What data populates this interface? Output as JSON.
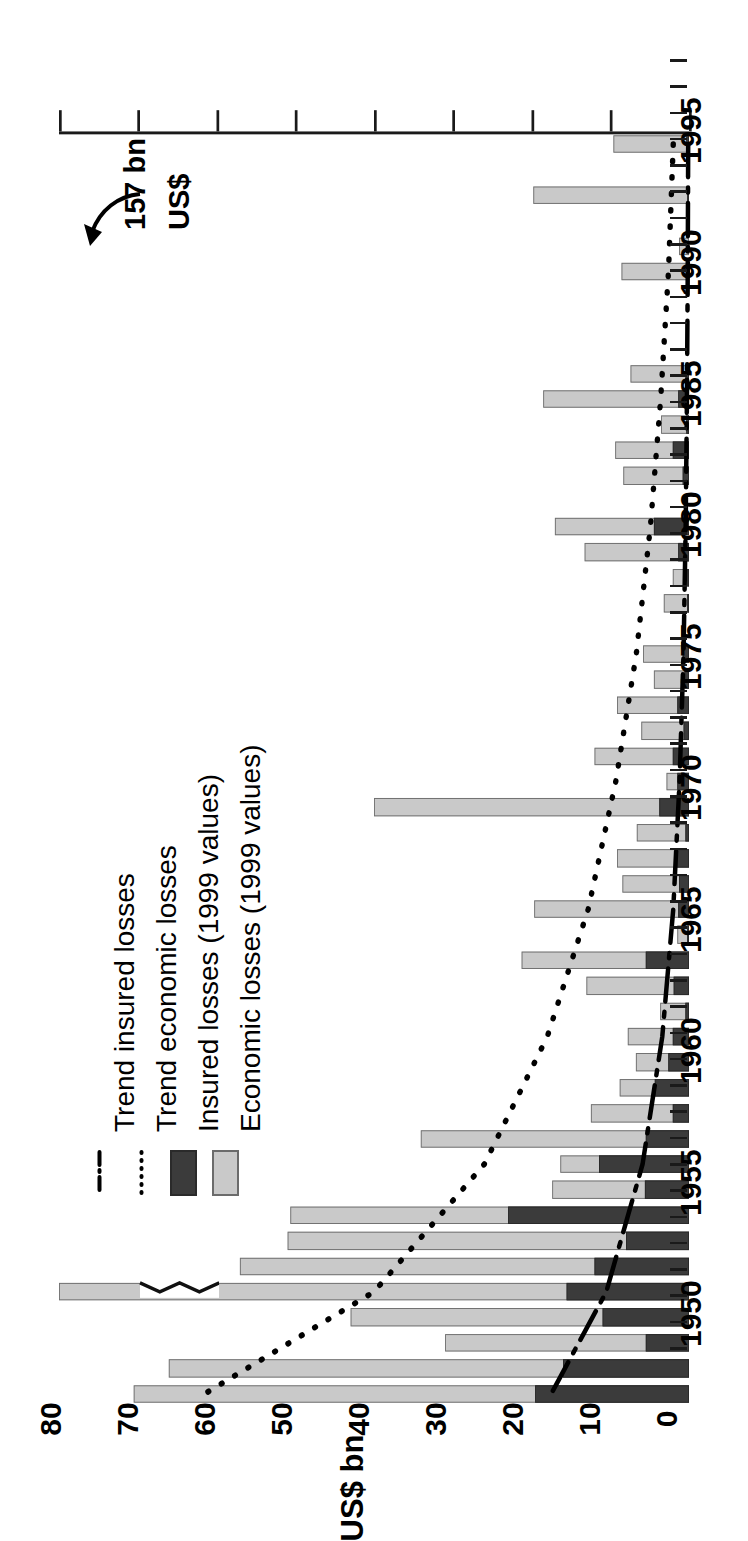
{
  "figure": {
    "orientation": "rotated-90",
    "value_axis_title": "US$ bn",
    "category_axis_name": "Year"
  },
  "legend": {
    "position": "left",
    "items": [
      {
        "label": "Economic losses (1999 values)",
        "marker": "filled-square",
        "color": "#c9c9c9",
        "name": "legend-economic-losses"
      },
      {
        "label": "Insured losses (1999 values)",
        "marker": "filled-square",
        "color": "#3b3b3b",
        "name": "legend-insured-losses"
      },
      {
        "label": "Trend economic losses",
        "marker": "dotted-line",
        "color": "#000000",
        "name": "legend-trend-economic"
      },
      {
        "label": "Trend insured losses",
        "marker": "dash-dot-line",
        "color": "#000000",
        "name": "legend-trend-insured"
      }
    ]
  },
  "annotation": {
    "text_line1": "157 bn",
    "text_line2": "US$",
    "points_to_year": 1995,
    "note": "broken bar with zigzag break"
  },
  "axis": {
    "value_ticks": [
      0,
      10,
      20,
      30,
      40,
      50,
      60,
      70,
      80
    ],
    "value_tick_labels": [
      "0",
      "10",
      "20",
      "30",
      "40",
      "50",
      "60",
      "70",
      "80"
    ],
    "value_min": 0,
    "value_max": 80,
    "year_tick_labels": [
      "1950",
      "1955",
      "1960",
      "1965",
      "1970",
      "1975",
      "1980",
      "1985",
      "1990",
      "1995"
    ],
    "year_min": 1950,
    "year_max": 1999
  },
  "chart_data": {
    "type": "bar",
    "orientation": "horizontal",
    "title": "",
    "subtitle": "",
    "xlabel": "US$ bn",
    "ylabel": "Year",
    "ylim": [
      0,
      80
    ],
    "grid": false,
    "legend_position": "left",
    "categories": [
      1950,
      1951,
      1952,
      1953,
      1954,
      1955,
      1956,
      1957,
      1958,
      1959,
      1960,
      1961,
      1962,
      1963,
      1964,
      1965,
      1966,
      1967,
      1968,
      1969,
      1970,
      1971,
      1972,
      1973,
      1974,
      1975,
      1976,
      1977,
      1978,
      1979,
      1980,
      1981,
      1982,
      1983,
      1984,
      1985,
      1986,
      1987,
      1988,
      1989,
      1990,
      1991,
      1992,
      1993,
      1994,
      1995,
      1996,
      1997,
      1998,
      1999
    ],
    "series": [
      {
        "name": "Economic losses (1999 values)",
        "color": "#c9c9c9",
        "values": [
          9.6,
          0.0,
          19.8,
          0.0,
          1.2,
          8.6,
          0.0,
          0.0,
          0.0,
          7.4,
          18.5,
          3.5,
          9.4,
          8.3,
          0.0,
          17.0,
          13.2,
          2.0,
          3.2,
          0.0,
          5.8,
          4.4,
          9.1,
          6.0,
          12.0,
          2.8,
          40.0,
          6.6,
          9.1,
          8.4,
          19.6,
          1.5,
          21.3,
          13.0,
          3.6,
          7.8,
          6.7,
          8.8,
          12.5,
          34.0,
          16.3,
          17.4,
          50.6,
          51.0,
          57.0,
          80.0,
          43.0,
          31.0,
          66.0,
          70.5
        ]
      },
      {
        "name": "Insured losses (1999 values)",
        "color": "#3b3b3b",
        "values": [
          0.3,
          0.0,
          0.2,
          0.0,
          0.0,
          0.3,
          0.0,
          0.0,
          0.0,
          0.4,
          1.4,
          0.3,
          2.1,
          0.8,
          0.0,
          4.4,
          1.4,
          0.2,
          0.2,
          0.0,
          0.8,
          0.6,
          1.5,
          0.7,
          2.1,
          1.5,
          3.8,
          0.5,
          1.6,
          1.2,
          1.4,
          0.2,
          5.5,
          1.9,
          0.5,
          2.1,
          2.6,
          4.3,
          2.0,
          5.5,
          11.4,
          5.6,
          23.0,
          8.0,
          12.0,
          15.5,
          11.0,
          5.5,
          16.0,
          19.5
        ]
      }
    ],
    "annotations": [
      {
        "text": "157 bn US$",
        "year": 1995,
        "value": 157,
        "note": "true economic loss for 1995; bar truncated with zigzag break"
      }
    ],
    "trend_lines": [
      {
        "name": "Trend economic losses",
        "style": "dotted",
        "color": "#000000",
        "points": [
          [
            1950,
            2.0
          ],
          [
            1955,
            2.6
          ],
          [
            1960,
            3.6
          ],
          [
            1965,
            4.9
          ],
          [
            1970,
            6.7
          ],
          [
            1975,
            9.3
          ],
          [
            1980,
            12.8
          ],
          [
            1985,
            18.0
          ],
          [
            1990,
            26.0
          ],
          [
            1995,
            40.0
          ],
          [
            1999,
            61.5
          ]
        ]
      },
      {
        "name": "Trend insured losses",
        "style": "dash-dot",
        "color": "#000000",
        "points": [
          [
            1950,
            0.1
          ],
          [
            1955,
            0.16
          ],
          [
            1960,
            0.26
          ],
          [
            1965,
            0.42
          ],
          [
            1970,
            0.7
          ],
          [
            1975,
            1.2
          ],
          [
            1980,
            2.0
          ],
          [
            1985,
            3.4
          ],
          [
            1990,
            5.9
          ],
          [
            1995,
            10.5
          ],
          [
            1999,
            17.5
          ]
        ]
      }
    ]
  }
}
